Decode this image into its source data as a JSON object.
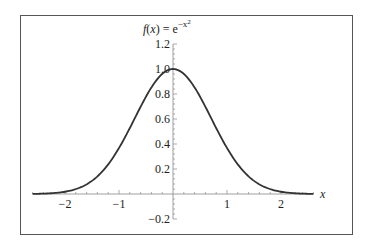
{
  "chart_data": {
    "type": "line",
    "title_parts": {
      "lhs": "f(x) = e",
      "exponent": "−x",
      "exp_power": "2"
    },
    "xlabel": "x",
    "ylabel": "",
    "xlim": [
      -2.6,
      2.6
    ],
    "ylim": [
      -0.2,
      1.2
    ],
    "x_ticks": [
      -2,
      -1,
      1,
      2
    ],
    "x_tick_labels": [
      "−2",
      "−1",
      "1",
      "2"
    ],
    "y_ticks": [
      -0.2,
      0.2,
      0.4,
      0.6,
      0.8,
      1.0,
      1.2
    ],
    "y_tick_labels": [
      "−0.2",
      "0.2",
      "0.4",
      "0.6",
      "0.8",
      "1.0",
      "1.2"
    ],
    "grid": false,
    "legend": null,
    "series": [
      {
        "name": "f(x) = e^{-x^2}",
        "color": "#333333",
        "x": [
          -2.6,
          -2.4,
          -2.2,
          -2.0,
          -1.8,
          -1.6,
          -1.4,
          -1.2,
          -1.0,
          -0.8,
          -0.6,
          -0.4,
          -0.2,
          0.0,
          0.2,
          0.4,
          0.6,
          0.8,
          1.0,
          1.2,
          1.4,
          1.6,
          1.8,
          2.0,
          2.2,
          2.4,
          2.6
        ],
        "values": [
          0.001,
          0.003,
          0.008,
          0.018,
          0.039,
          0.077,
          0.141,
          0.237,
          0.368,
          0.527,
          0.698,
          0.852,
          0.961,
          1.0,
          0.961,
          0.852,
          0.698,
          0.527,
          0.368,
          0.237,
          0.141,
          0.077,
          0.039,
          0.018,
          0.008,
          0.003,
          0.001
        ]
      }
    ]
  }
}
